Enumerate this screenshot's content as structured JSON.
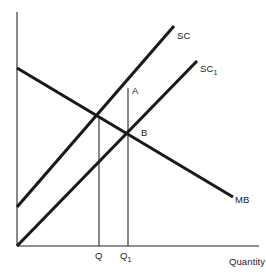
{
  "diagram": {
    "axes": {
      "x_label": "Quantity",
      "y_label": "",
      "origin": {
        "x": 17,
        "y": 246
      },
      "x_axis_end": {
        "x": 259,
        "y": 246
      },
      "y_axis_top": {
        "x": 17,
        "y": 12
      }
    },
    "curves": [
      {
        "id": "sc",
        "label": "SC",
        "label_sub": "",
        "color": "#1a1a1a",
        "from": {
          "x": 17,
          "y": 207
        },
        "to": {
          "x": 174,
          "y": 26
        }
      },
      {
        "id": "sc1",
        "label": "SC",
        "label_sub": "1",
        "color": "#1a1a1a",
        "from": {
          "x": 17,
          "y": 246
        },
        "to": {
          "x": 197,
          "y": 61
        }
      },
      {
        "id": "mb",
        "label": "MB",
        "label_sub": "",
        "color": "#1a1a1a",
        "from": {
          "x": 17,
          "y": 68
        },
        "to": {
          "x": 233,
          "y": 197
        }
      }
    ],
    "points": [
      {
        "id": "a",
        "label": "A",
        "x": 128,
        "y": 94
      },
      {
        "id": "b",
        "label": "B",
        "x": 128,
        "y": 133
      }
    ],
    "guides": [
      {
        "id": "q-guide",
        "x": 99,
        "y_top": 118,
        "y_bottom": 246
      },
      {
        "id": "q1-guide",
        "x": 128,
        "y_top": 88,
        "y_bottom": 246
      }
    ],
    "tick_labels": [
      {
        "id": "q",
        "label": "Q",
        "sub": "",
        "x": 99
      },
      {
        "id": "q1",
        "label": "Q",
        "sub": "1",
        "x": 128
      }
    ],
    "colors": {
      "curve": "#1a1a1a",
      "axis": "#6b6b6b",
      "guide": "#2a2a2a",
      "text": "#1d1d1d",
      "background": "#ffffff"
    }
  }
}
